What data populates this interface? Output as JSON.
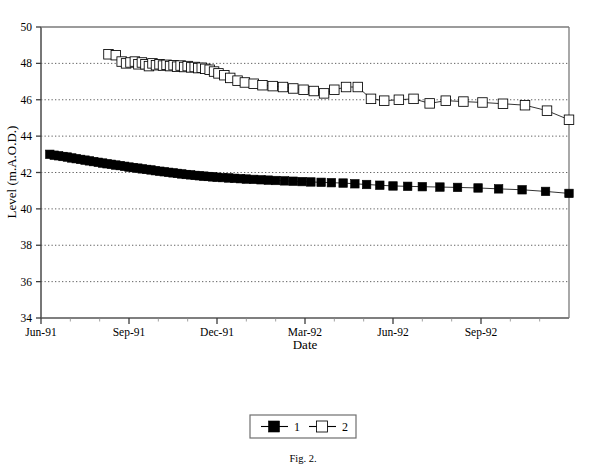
{
  "figure": {
    "caption": "Fig. 2.",
    "background_color": "#ffffff",
    "ink_color": "#000000"
  },
  "legend": {
    "position": "below-plot",
    "entries": [
      {
        "label": "1",
        "marker": "filled-square",
        "color": "#000000"
      },
      {
        "label": "2",
        "marker": "open-square",
        "color": "#000000"
      }
    ]
  },
  "chart_data": {
    "type": "line",
    "title": "",
    "subtitle": "",
    "xlabel": "Date",
    "ylabel": "Level (m.A.O.D.)",
    "ylim": [
      34,
      50
    ],
    "ytick_step": 2,
    "yticks": [
      34,
      36,
      38,
      40,
      42,
      44,
      46,
      48,
      50
    ],
    "ytick_labels": [
      "34",
      "36",
      "38",
      "40",
      "42",
      "44",
      "46",
      "48",
      "50"
    ],
    "xlim_months": [
      0,
      18
    ],
    "xticks_major_months": [
      0,
      3,
      6,
      9,
      12,
      15
    ],
    "xtick_labels": [
      "Jun-91",
      "Sep-91",
      "Dec-91",
      "Mar-92",
      "Jun-92",
      "Sep-92"
    ],
    "xticks_minor_months": [
      1,
      2,
      4,
      5,
      7,
      8,
      10,
      11,
      13,
      14,
      16,
      17
    ],
    "grid": true,
    "grid_style": "dotted-horizontal",
    "legend_position": "below",
    "annotations": [],
    "series": [
      {
        "name": "1",
        "marker": "filled-square",
        "x_months": [
          0.3,
          0.45,
          0.6,
          0.75,
          0.9,
          1.05,
          1.2,
          1.35,
          1.5,
          1.65,
          1.8,
          1.95,
          2.1,
          2.25,
          2.4,
          2.55,
          2.7,
          2.85,
          3.0,
          3.15,
          3.3,
          3.45,
          3.6,
          3.75,
          3.9,
          4.05,
          4.2,
          4.35,
          4.5,
          4.65,
          4.8,
          4.95,
          5.1,
          5.25,
          5.4,
          5.55,
          5.7,
          5.85,
          6.0,
          6.2,
          6.4,
          6.6,
          6.8,
          7.0,
          7.25,
          7.5,
          7.75,
          8.0,
          8.3,
          8.6,
          8.9,
          9.2,
          9.55,
          9.9,
          10.3,
          10.7,
          11.1,
          11.55,
          12.0,
          12.5,
          13.0,
          13.6,
          14.2,
          14.9,
          15.6,
          16.4,
          17.2,
          18.0
        ],
        "y_values": [
          43.0,
          42.95,
          42.92,
          42.88,
          42.85,
          42.8,
          42.76,
          42.72,
          42.68,
          42.64,
          42.6,
          42.56,
          42.52,
          42.48,
          42.45,
          42.41,
          42.38,
          42.34,
          42.3,
          42.27,
          42.24,
          42.2,
          42.17,
          42.14,
          42.1,
          42.07,
          42.04,
          42.01,
          41.98,
          41.95,
          41.92,
          41.89,
          41.87,
          41.84,
          41.82,
          41.8,
          41.78,
          41.76,
          41.74,
          41.72,
          41.7,
          41.68,
          41.66,
          41.64,
          41.62,
          41.6,
          41.58,
          41.56,
          41.54,
          41.52,
          41.5,
          41.48,
          41.46,
          41.44,
          41.42,
          41.38,
          41.34,
          41.3,
          41.26,
          41.24,
          41.22,
          41.2,
          41.18,
          41.15,
          41.1,
          41.05,
          40.96,
          40.85
        ]
      },
      {
        "name": "2",
        "marker": "open-square",
        "x_months": [
          2.3,
          2.55,
          2.75,
          2.9,
          3.05,
          3.2,
          3.32,
          3.44,
          3.56,
          3.68,
          3.8,
          3.92,
          4.04,
          4.16,
          4.28,
          4.4,
          4.52,
          4.64,
          4.76,
          4.88,
          5.0,
          5.12,
          5.24,
          5.36,
          5.48,
          5.6,
          5.75,
          5.9,
          6.05,
          6.25,
          6.45,
          6.7,
          6.95,
          7.25,
          7.55,
          7.9,
          8.25,
          8.6,
          8.95,
          9.3,
          9.65,
          10.0,
          10.4,
          10.8,
          11.25,
          11.7,
          12.2,
          12.7,
          13.25,
          13.8,
          14.4,
          15.05,
          15.75,
          16.5,
          17.25,
          18.0
        ],
        "y_values": [
          48.5,
          48.45,
          48.1,
          48.0,
          48.05,
          48.1,
          47.95,
          48.05,
          47.95,
          47.85,
          48.0,
          47.9,
          47.95,
          47.88,
          47.92,
          47.85,
          47.9,
          47.82,
          47.88,
          47.8,
          47.85,
          47.78,
          47.8,
          47.74,
          47.76,
          47.7,
          47.65,
          47.55,
          47.45,
          47.35,
          47.2,
          47.05,
          46.95,
          46.88,
          46.8,
          46.75,
          46.7,
          46.62,
          46.55,
          46.48,
          46.35,
          46.55,
          46.7,
          46.7,
          46.05,
          45.95,
          46.0,
          46.05,
          45.8,
          45.95,
          45.9,
          45.85,
          45.78,
          45.7,
          45.4,
          44.9
        ]
      }
    ]
  }
}
